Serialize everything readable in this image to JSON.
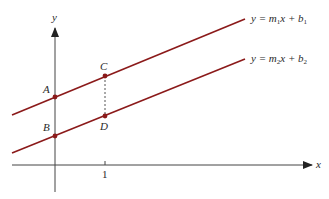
{
  "diagram": {
    "type": "parallel-lines-graph",
    "axes": {
      "x_label": "x",
      "y_label": "y",
      "x_tick_label": "1",
      "axis_color": "#444444"
    },
    "lines": [
      {
        "name": "line-1",
        "equation_prefix": "y = m",
        "m_sub": "1",
        "middle": "x + b",
        "b_sub": "1",
        "color": "#8b1a1a"
      },
      {
        "name": "line-2",
        "equation_prefix": "y = m",
        "m_sub": "2",
        "middle": "x + b",
        "b_sub": "2",
        "color": "#8b1a1a"
      }
    ],
    "points": {
      "A": "A",
      "B": "B",
      "C": "C",
      "D": "D"
    },
    "point_color": "#8b1a1a"
  }
}
